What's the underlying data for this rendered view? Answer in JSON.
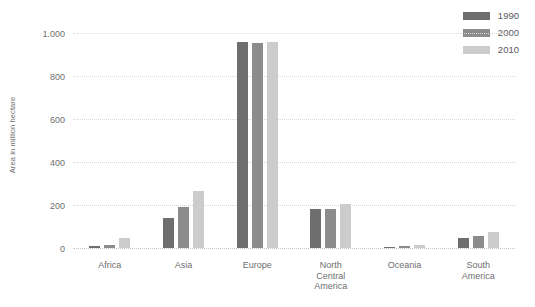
{
  "chart_data": {
    "type": "bar",
    "title": "",
    "subtitle": "",
    "xlabel": "",
    "ylabel": "Area in million hectare",
    "ylim": [
      0,
      1000
    ],
    "ytick_labels": [
      "1.000",
      "800",
      "600",
      "400",
      "200",
      "0"
    ],
    "ytick_values": [
      1000,
      800,
      600,
      400,
      200,
      0
    ],
    "grid": true,
    "grid_axis": "y",
    "legend_position": "top-right",
    "categories": [
      "Africa",
      "Asia",
      "Europe",
      "North\nCentral\nAmerica",
      "Oceania",
      "South\nAmerica"
    ],
    "series": [
      {
        "name": "1990",
        "color": "#6e6e6e",
        "values": [
          10,
          140,
          958,
          180,
          6,
          45
        ]
      },
      {
        "name": "2000",
        "color": "#8c8c8c",
        "values": [
          16,
          190,
          955,
          182,
          8,
          56
        ]
      },
      {
        "name": "2010",
        "color": "#cccccc",
        "values": [
          45,
          265,
          957,
          203,
          13,
          76
        ]
      }
    ]
  },
  "legend": {
    "items": [
      {
        "label": "1990",
        "color": "#6e6e6e"
      },
      {
        "label": "2000",
        "color": "#8c8c8c"
      },
      {
        "label": "2010",
        "color": "#cccccc"
      }
    ]
  }
}
